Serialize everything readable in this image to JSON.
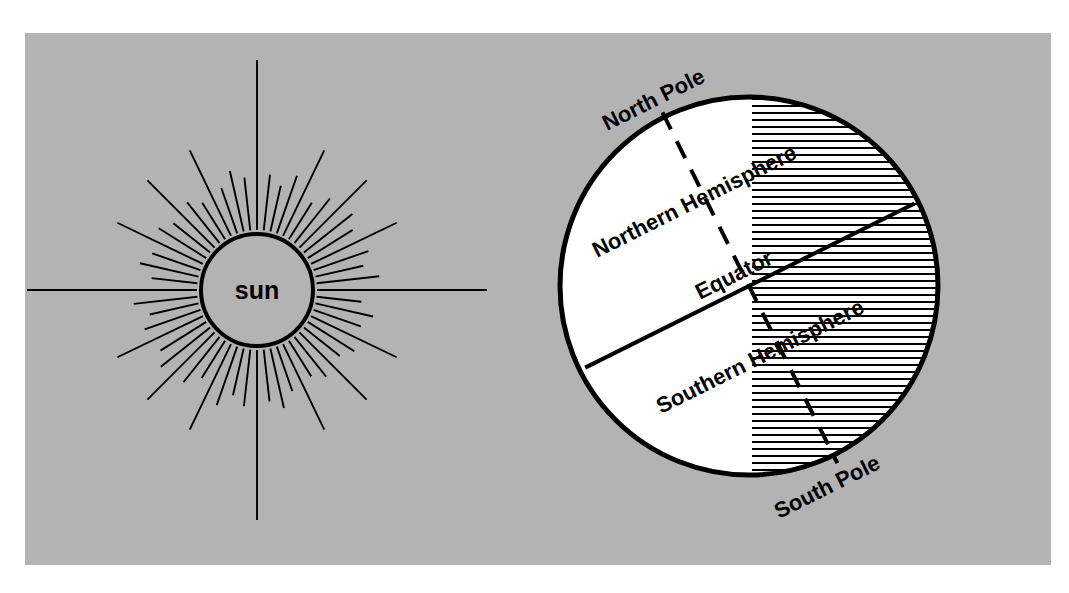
{
  "figure": {
    "background_color": "#ffffff",
    "panel_color": "#b3b3b3",
    "ink_color": "#000000",
    "lit_color": "#ffffff"
  },
  "sun": {
    "label": "sun",
    "center_x": 257,
    "center_y": 290,
    "radius": 56,
    "fill": "#b3b3b3",
    "stroke": "#000000",
    "ray_count": 56,
    "ray_inner_radius": 60,
    "ray_short_length": 42,
    "ray_long_length": 95,
    "ray_extra_long_length": 170
  },
  "earth": {
    "center_x": 749,
    "center_y": 286,
    "radius": 189,
    "terminator_x": 752,
    "lit_fill": "#ffffff",
    "dark_fill_style": "horizontal-hatch",
    "hatch_spacing": 7,
    "hatch_stroke_width": 2.2,
    "axis_tilt_deg": 23.5,
    "equator_angle_deg": -26.5,
    "labels": {
      "north_pole": "North Pole",
      "south_pole": "South Pole",
      "northern_hemisphere": "Northern Hemisphere",
      "southern_hemisphere": "Southern Hemisphere",
      "equator": "Equator"
    },
    "label_rotation_deg": -26.5,
    "label_font_sizes": {
      "pole": 22,
      "hemisphere": 22,
      "equator": 22
    }
  },
  "chart_data": {
    "type": "diagram",
    "elements": [
      {
        "name": "sun",
        "label": "sun",
        "shape": "circle-with-rays"
      },
      {
        "name": "earth",
        "label": "",
        "shape": "circle"
      },
      {
        "name": "axis",
        "label": "",
        "shape": "dashed-line",
        "note": "tilted rotation axis from North Pole to South Pole"
      },
      {
        "name": "equator",
        "label": "Equator",
        "shape": "solid-line",
        "note": "perpendicular to axis"
      },
      {
        "name": "terminator",
        "label": "",
        "shape": "vertical-line",
        "note": "boundary between lit (white) and dark (hatched) sides"
      },
      {
        "name": "north-pole",
        "label": "North Pole",
        "shape": "text"
      },
      {
        "name": "south-pole",
        "label": "South Pole",
        "shape": "text"
      },
      {
        "name": "northern-hemisphere",
        "label": "Northern Hemisphere",
        "shape": "text"
      },
      {
        "name": "southern-hemisphere",
        "label": "Southern Hemisphere",
        "shape": "text"
      }
    ]
  }
}
